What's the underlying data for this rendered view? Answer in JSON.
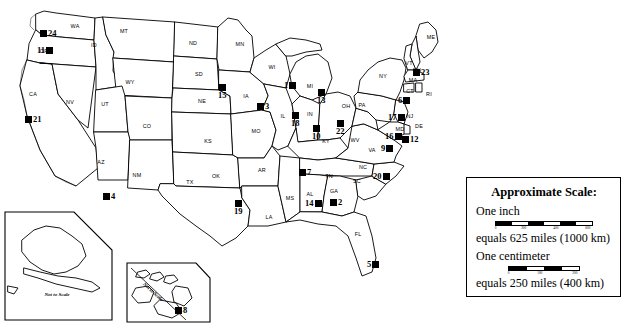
{
  "map": {
    "title": "United States map with numbered site markers",
    "state_labels": [
      {
        "abbr": "WA",
        "x": 75,
        "y": 28
      },
      {
        "abbr": "OR",
        "x": 44,
        "y": 53
      },
      {
        "abbr": "CA",
        "x": 33,
        "y": 96
      },
      {
        "abbr": "NV",
        "x": 70,
        "y": 104
      },
      {
        "abbr": "ID",
        "x": 94,
        "y": 47
      },
      {
        "abbr": "MT",
        "x": 124,
        "y": 33
      },
      {
        "abbr": "WY",
        "x": 130,
        "y": 84
      },
      {
        "abbr": "UT",
        "x": 105,
        "y": 106
      },
      {
        "abbr": "AZ",
        "x": 101,
        "y": 164
      },
      {
        "abbr": "NM",
        "x": 137,
        "y": 177
      },
      {
        "abbr": "CO",
        "x": 147,
        "y": 128
      },
      {
        "abbr": "ND",
        "x": 193,
        "y": 45
      },
      {
        "abbr": "SD",
        "x": 199,
        "y": 76
      },
      {
        "abbr": "NE",
        "x": 202,
        "y": 103
      },
      {
        "abbr": "KS",
        "x": 208,
        "y": 143
      },
      {
        "abbr": "OK",
        "x": 216,
        "y": 178
      },
      {
        "abbr": "TX",
        "x": 190,
        "y": 184
      },
      {
        "abbr": "MN",
        "x": 240,
        "y": 46
      },
      {
        "abbr": "IA",
        "x": 246,
        "y": 98
      },
      {
        "abbr": "MO",
        "x": 256,
        "y": 133
      },
      {
        "abbr": "AR",
        "x": 262,
        "y": 172
      },
      {
        "abbr": "LA",
        "x": 269,
        "y": 219
      },
      {
        "abbr": "WI",
        "x": 272,
        "y": 69
      },
      {
        "abbr": "IL",
        "x": 283,
        "y": 118
      },
      {
        "abbr": "MS",
        "x": 290,
        "y": 200
      },
      {
        "abbr": "MI",
        "x": 310,
        "y": 88
      },
      {
        "abbr": "IN",
        "x": 310,
        "y": 116
      },
      {
        "abbr": "KY",
        "x": 326,
        "y": 143
      },
      {
        "abbr": "TN",
        "x": 329,
        "y": 178
      },
      {
        "abbr": "AL",
        "x": 310,
        "y": 196
      },
      {
        "abbr": "GA",
        "x": 334,
        "y": 193
      },
      {
        "abbr": "FL",
        "x": 358,
        "y": 236
      },
      {
        "abbr": "OH",
        "x": 346,
        "y": 108
      },
      {
        "abbr": "WV",
        "x": 355,
        "y": 142
      },
      {
        "abbr": "SC",
        "x": 357,
        "y": 183
      },
      {
        "abbr": "NC",
        "x": 363,
        "y": 169
      },
      {
        "abbr": "VA",
        "x": 372,
        "y": 152
      },
      {
        "abbr": "PA",
        "x": 362,
        "y": 107
      },
      {
        "abbr": "NY",
        "x": 383,
        "y": 78
      },
      {
        "abbr": "ME",
        "x": 431,
        "y": 39
      },
      {
        "abbr": "VT",
        "x": 409,
        "y": 65
      },
      {
        "abbr": "NH",
        "x": 417,
        "y": 72
      },
      {
        "abbr": "MA",
        "x": 413,
        "y": 82
      },
      {
        "abbr": "CT",
        "x": 410,
        "y": 93
      },
      {
        "abbr": "RI",
        "x": 429,
        "y": 96
      },
      {
        "abbr": "NJ",
        "x": 410,
        "y": 118
      },
      {
        "abbr": "DE",
        "x": 419,
        "y": 128
      },
      {
        "abbr": "MD",
        "x": 400,
        "y": 131
      },
      {
        "abbr": "AK",
        "x": 57,
        "y": 258
      },
      {
        "abbr": "HI",
        "x": 176,
        "y": 272
      }
    ],
    "markers": [
      {
        "num": "24",
        "x": 44,
        "y": 33,
        "pos": "lbl-right"
      },
      {
        "num": "11",
        "x": 41,
        "y": 50,
        "pos": "lbl-left"
      },
      {
        "num": "21",
        "x": 29,
        "y": 119,
        "pos": "lbl-right"
      },
      {
        "num": "4",
        "x": 107,
        "y": 196,
        "pos": "lbl-right"
      },
      {
        "num": "15",
        "x": 222,
        "y": 88,
        "pos": "lbl-below"
      },
      {
        "num": "3",
        "x": 261,
        "y": 106,
        "pos": "lbl-right"
      },
      {
        "num": "19",
        "x": 238,
        "y": 204,
        "pos": "lbl-below"
      },
      {
        "num": "1",
        "x": 288,
        "y": 85,
        "pos": "lbl-left"
      },
      {
        "num": "13",
        "x": 321,
        "y": 93,
        "pos": "lbl-below"
      },
      {
        "num": "18",
        "x": 295,
        "y": 116,
        "pos": "lbl-below"
      },
      {
        "num": "10",
        "x": 316,
        "y": 129,
        "pos": "lbl-below"
      },
      {
        "num": "22",
        "x": 340,
        "y": 124,
        "pos": "lbl-below"
      },
      {
        "num": "7",
        "x": 303,
        "y": 172,
        "pos": "lbl-right"
      },
      {
        "num": "14",
        "x": 309,
        "y": 203,
        "pos": "lbl-left"
      },
      {
        "num": "2",
        "x": 334,
        "y": 202,
        "pos": "lbl-right"
      },
      {
        "num": "20",
        "x": 377,
        "y": 176,
        "pos": "lbl-left"
      },
      {
        "num": "5",
        "x": 371,
        "y": 264,
        "pos": "lbl-left"
      },
      {
        "num": "17",
        "x": 392,
        "y": 117,
        "pos": "lbl-left"
      },
      {
        "num": "16",
        "x": 389,
        "y": 136,
        "pos": "lbl-left"
      },
      {
        "num": "9",
        "x": 385,
        "y": 148,
        "pos": "lbl-left"
      },
      {
        "num": "12",
        "x": 406,
        "y": 139,
        "pos": "lbl-right"
      },
      {
        "num": "6",
        "x": 402,
        "y": 100,
        "pos": "lbl-left"
      },
      {
        "num": "23",
        "x": 417,
        "y": 72,
        "pos": "lbl-right"
      },
      {
        "num": "8",
        "x": 179,
        "y": 310,
        "pos": "lbl-right"
      }
    ],
    "insets": [
      {
        "name": "alaska-inset",
        "note": "Not to Scale",
        "label": "AK"
      },
      {
        "name": "hawaii-inset",
        "note": "Not to Scale",
        "label": "HI"
      }
    ]
  },
  "legend": {
    "title": "Approximate Scale:",
    "inch_label": "One inch",
    "inch_equals": "equals 625 miles (1000 km)",
    "cm_label": "One centimeter",
    "cm_equals": "equals 250 miles (400 km)",
    "inch_ticks": [
      "0",
      "200",
      "400",
      "600"
    ],
    "cm_ticks": [
      "0",
      "100",
      "200"
    ]
  },
  "colors": {
    "ink": "#000000",
    "paper": "#ffffff"
  }
}
